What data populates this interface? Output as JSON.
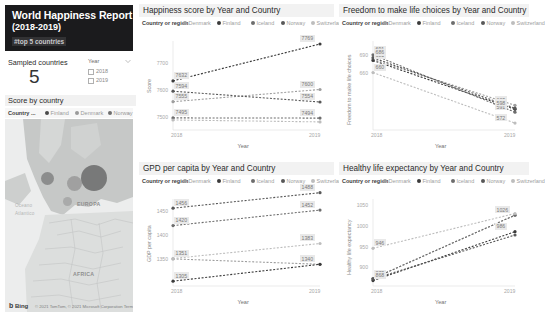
{
  "header": {
    "title_main": "World Happiness Report",
    "title_sub": "(2018-2019)",
    "title_note": "#top 5 countries"
  },
  "sampled": {
    "label": "Sampled countries",
    "value": "5"
  },
  "year_slicer": {
    "heading": "Year",
    "caret_icon": "chevron-down-icon",
    "options": [
      "2018",
      "2019"
    ]
  },
  "map_card": {
    "title": "Score by country",
    "legend_label": "Country ...",
    "legend_items": [
      {
        "name": "Finland",
        "color": "#4a4a4a"
      },
      {
        "name": "Denmark",
        "color": "#9a9a9a"
      },
      {
        "name": "Norway",
        "color": "#6e6e6e"
      }
    ],
    "more_icon": "legend-overflow-icon",
    "region_labels": [
      "EUROPA",
      "AFRICA"
    ],
    "ocean_labels": [
      "Oceano",
      "Atlantico"
    ],
    "brand": "Bing",
    "attribution": "© 2021 TomTom, © 2021 Microsoft Corporation Terms"
  },
  "colors": {
    "denmark": "#9e9e9e",
    "finland": "#3b3b3b",
    "iceland": "#6d6d6d",
    "norway": "#585858",
    "switzerland": "#bdbdbd",
    "panel_title_bg": "#f2f2f2",
    "label_bg": "#e9e9e9"
  },
  "legend": {
    "label": "Country or region",
    "items": [
      "Denmark",
      "Finland",
      "Iceland",
      "Norway",
      "Switzerland"
    ]
  },
  "chart_data": [
    {
      "id": "happiness",
      "type": "line",
      "title": "Happiness score by Year and Country",
      "xlabel": "Year",
      "ylabel": "Score",
      "x": [
        "2018",
        "2019"
      ],
      "yticks": [
        "7700",
        "7600",
        "7500"
      ],
      "ylim": [
        7450,
        7780
      ],
      "legend_position": "top",
      "series": [
        {
          "name": "Denmark",
          "values": [
            7555,
            7600
          ],
          "color": "#9e9e9e",
          "labels": [
            "7555",
            "7600"
          ]
        },
        {
          "name": "Finland",
          "values": [
            7632,
            7769
          ],
          "color": "#3b3b3b",
          "labels": [
            "7632",
            "7769"
          ]
        },
        {
          "name": "Iceland",
          "values": [
            7495,
            7494
          ],
          "color": "#6d6d6d",
          "labels": [
            "7495",
            "7494"
          ]
        },
        {
          "name": "Norway",
          "values": [
            7594,
            7554
          ],
          "color": "#585858",
          "labels": [
            "7594",
            "7554"
          ]
        },
        {
          "name": "Switzerland",
          "values": [
            7487,
            7480
          ],
          "color": "#bdbdbd",
          "labels": [
            "",
            ""
          ]
        }
      ]
    },
    {
      "id": "freedom",
      "type": "line",
      "title": "Freedom to make life choices by Year and Country",
      "xlabel": "Year",
      "ylabel": "Freedom to make life choices",
      "x": [
        "2018",
        "2019"
      ],
      "yticks": [
        "690",
        "660"
      ],
      "ylim": [
        560,
        715
      ],
      "legend_position": "top",
      "series": [
        {
          "name": "Denmark",
          "values": [
            683,
            603
          ],
          "color": "#9e9e9e",
          "labels": [
            "683",
            "603"
          ]
        },
        {
          "name": "Finland",
          "values": [
            681,
            596
          ],
          "color": "#3b3b3b",
          "labels": [
            "681",
            "596"
          ]
        },
        {
          "name": "Iceland",
          "values": [
            691,
            591
          ],
          "color": "#6d6d6d",
          "labels": [
            "691",
            "591"
          ]
        },
        {
          "name": "Norway",
          "values": [
            686,
            598
          ],
          "color": "#585858",
          "labels": [
            "686",
            "598"
          ]
        },
        {
          "name": "Switzerland",
          "values": [
            660,
            572
          ],
          "color": "#bdbdbd",
          "labels": [
            "660",
            "572"
          ]
        }
      ]
    },
    {
      "id": "gdp",
      "type": "line",
      "title": "GPD per capita by Year and Country",
      "xlabel": "Year",
      "ylabel": "GDP per capita",
      "x": [
        "2018",
        "2019"
      ],
      "yticks": [
        "1450",
        "1400",
        "1350"
      ],
      "ylim": [
        1295,
        1475
      ],
      "legend_position": "top",
      "series": [
        {
          "name": "Denmark",
          "values": [
            1351,
            1340
          ],
          "color": "#9e9e9e",
          "labels": [
            "1351",
            "1340"
          ]
        },
        {
          "name": "Finland",
          "values": [
            1305,
            1340
          ],
          "color": "#3b3b3b",
          "labels": [
            "1305",
            "1340"
          ]
        },
        {
          "name": "Iceland",
          "values": [
            1420,
            1452
          ],
          "color": "#6d6d6d",
          "labels": [
            "1420",
            "1452"
          ]
        },
        {
          "name": "Norway",
          "values": [
            1456,
            1488
          ],
          "color": "#585858",
          "labels": [
            "1456",
            "1488"
          ]
        },
        {
          "name": "Switzerland",
          "values": [
            1352,
            1383
          ],
          "color": "#bdbdbd",
          "labels": [
            "",
            "1383"
          ]
        }
      ]
    },
    {
      "id": "health",
      "type": "line",
      "title": "Healthy life expectancy by Year and Country",
      "xlabel": "Year",
      "ylabel": "Healthy life expectancy",
      "x": [
        "2018",
        "2019"
      ],
      "yticks": [
        "1050",
        "1000",
        "950",
        "900"
      ],
      "ylim": [
        855,
        1065
      ],
      "legend_position": "top",
      "series": [
        {
          "name": "Denmark",
          "values": [
            873,
            1026
          ],
          "color": "#9e9e9e",
          "labels": [
            "873",
            "1026"
          ]
        },
        {
          "name": "Finland",
          "values": [
            868,
            986
          ],
          "color": "#3b3b3b",
          "labels": [
            "868",
            "986"
          ]
        },
        {
          "name": "Iceland",
          "values": [
            873,
            1026
          ],
          "color": "#6d6d6d",
          "labels": [
            "",
            ""
          ]
        },
        {
          "name": "Norway",
          "values": [
            872,
            978
          ],
          "color": "#585858",
          "labels": [
            "",
            ""
          ]
        },
        {
          "name": "Switzerland",
          "values": [
            946,
            1030
          ],
          "color": "#bdbdbd",
          "labels": [
            "946",
            ""
          ]
        }
      ]
    }
  ]
}
